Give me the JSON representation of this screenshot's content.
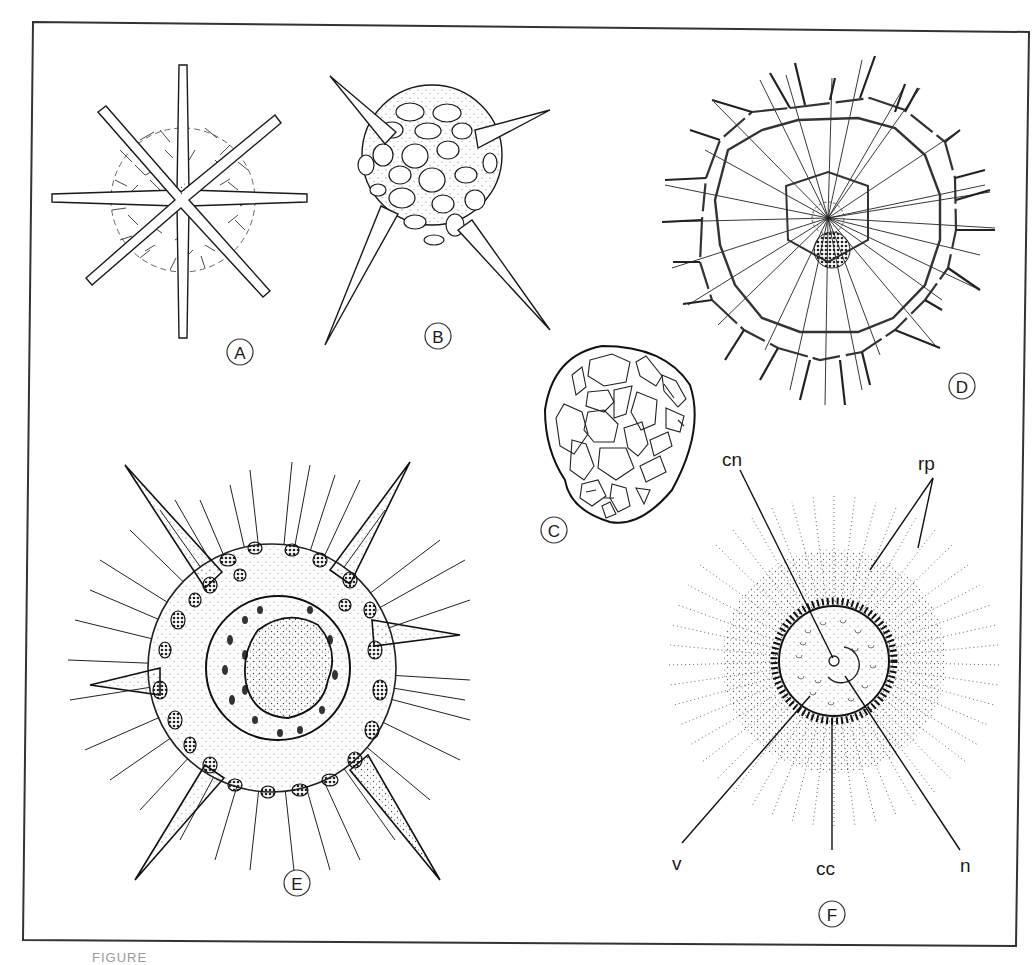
{
  "figure": {
    "panels": [
      {
        "id": "A",
        "label": "A",
        "description": "spherical radiolarian with six rod spines and latticed shell",
        "label_pos": [
          240,
          352
        ]
      },
      {
        "id": "B",
        "label": "B",
        "description": "latticed sphere with four tapering spines",
        "label_pos": [
          438,
          336
        ]
      },
      {
        "id": "C",
        "label": "C",
        "description": "ovoid latticed shell",
        "label_pos": [
          554,
          530
        ]
      },
      {
        "id": "D",
        "label": "D",
        "description": "concentric hexagonal lattice with radiating spines",
        "label_pos": [
          962,
          386
        ]
      },
      {
        "id": "E",
        "label": "E",
        "description": "spiny double shell with six large spines",
        "label_pos": [
          297,
          883
        ]
      },
      {
        "id": "F",
        "label": "F",
        "description": "living radiolarian cross-section with central capsule and pseudopodia",
        "label_pos": [
          832,
          914
        ]
      }
    ],
    "annotations_F": [
      {
        "key": "cn",
        "text": "cn",
        "pos": [
          722,
          466
        ]
      },
      {
        "key": "rp",
        "text": "rp",
        "pos": [
          918,
          470
        ]
      },
      {
        "key": "v",
        "text": "v",
        "pos": [
          672,
          870
        ]
      },
      {
        "key": "cc",
        "text": "cc",
        "pos": [
          816,
          875
        ]
      },
      {
        "key": "n",
        "text": "n",
        "pos": [
          960,
          872
        ]
      }
    ],
    "caption_fragment": "FIGURE"
  },
  "colors": {
    "ink": "#1a1a1a",
    "paper": "#ffffff",
    "frame": "#333333",
    "stipple": "#444444"
  }
}
